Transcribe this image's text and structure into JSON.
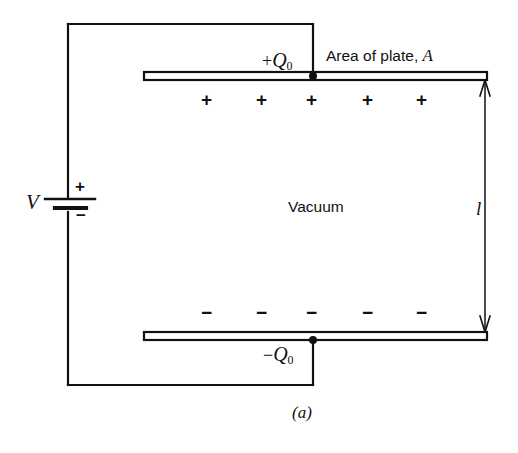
{
  "figure": {
    "domain_kind": "physics-diagram",
    "caption": "(a)",
    "background_color": "#ffffff",
    "ink_color": "#111111",
    "labels": {
      "area_of_plate_prefix": "Area of plate,",
      "area_of_plate_symbol": "A",
      "vacuum": "Vacuum",
      "voltage_symbol": "V",
      "separation_symbol": "l",
      "battery_positive": "+",
      "battery_negative": "−",
      "top_charge_sign": "+",
      "top_charge_symbol": "Q",
      "top_charge_subscript": "0",
      "bottom_charge_sign": "−",
      "bottom_charge_symbol": "Q",
      "bottom_charge_subscript": "0"
    },
    "top_plate_charge_signs": [
      "+",
      "+",
      "+",
      "+",
      "+"
    ],
    "bottom_plate_charge_signs": [
      "−",
      "−",
      "−",
      "−",
      "−"
    ],
    "components": {
      "battery": "voltage-source",
      "top_plate": "capacitor-plate-positive",
      "bottom_plate": "capacitor-plate-negative",
      "dielectric_region": "Vacuum",
      "separation_arrow": "double-headed-vertical-arrow"
    }
  }
}
